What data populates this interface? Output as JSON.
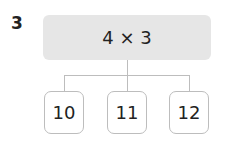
{
  "question_number": "3",
  "expression": "4 × 3",
  "options": [
    "10",
    "11",
    "12"
  ],
  "colors": {
    "box_fill": "#e6e6e6",
    "line": "#bdbdbd"
  }
}
